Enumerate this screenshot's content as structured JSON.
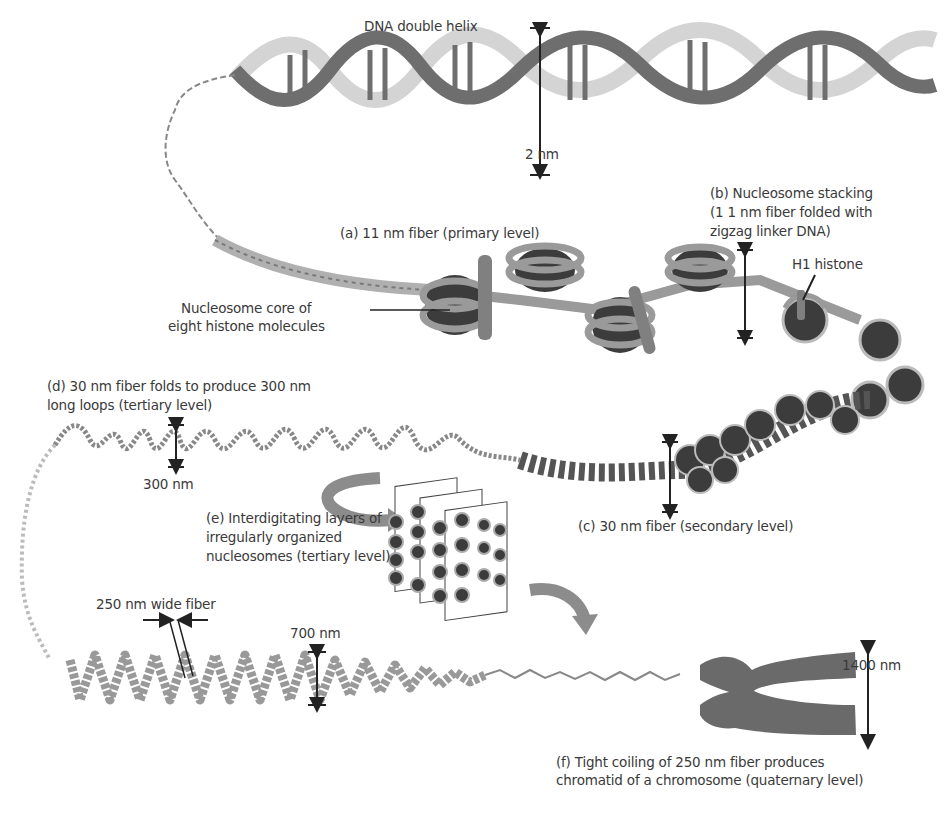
{
  "diagram": {
    "colors": {
      "strand_dark": "#6e6e6e",
      "strand_light": "#d4d4d4",
      "histone_core": "#3c3c3c",
      "histone_wrap": "#9a9a9a",
      "h1": "#808080",
      "arrow": "#222222",
      "curved_arrow": "#8c8c8c",
      "chromosome": "#6a6a6a"
    }
  },
  "labels": {
    "dna_helix": "DNA double helix",
    "two_nm": "2 nm",
    "fiber_11nm": "(a) 11 nm fiber (primary level)",
    "nucleosome_core_line1": "Nucleosome core of",
    "nucleosome_core_line2": "eight histone molecules",
    "stacking_line1": "(b) Nucleosome stacking",
    "stacking_line2": "(1 1 nm fiber folded with",
    "stacking_line3": "zigzag linker DNA)",
    "h1_histone": "H1 histone",
    "loops_line1": "(d) 30 nm fiber folds to produce 300 nm",
    "loops_line2": "long loops (tertiary level)",
    "three_hundred_nm": "300 nm",
    "fiber_30nm": "(c) 30 nm fiber (secondary level)",
    "interdig_line1": "(e) Interdigitating layers of",
    "interdig_line2": "irregularly organized",
    "interdig_line3": "nucleosomes (tertiary level)",
    "wide_fiber": "250 nm wide fiber",
    "seven_hundred_nm": "700 nm",
    "fourteen_hundred_nm": "1400 nm",
    "coiling_line1": "(f) Tight coiling of 250 nm fiber produces",
    "coiling_line2": "chromatid of a chromosome (quaternary level)"
  }
}
